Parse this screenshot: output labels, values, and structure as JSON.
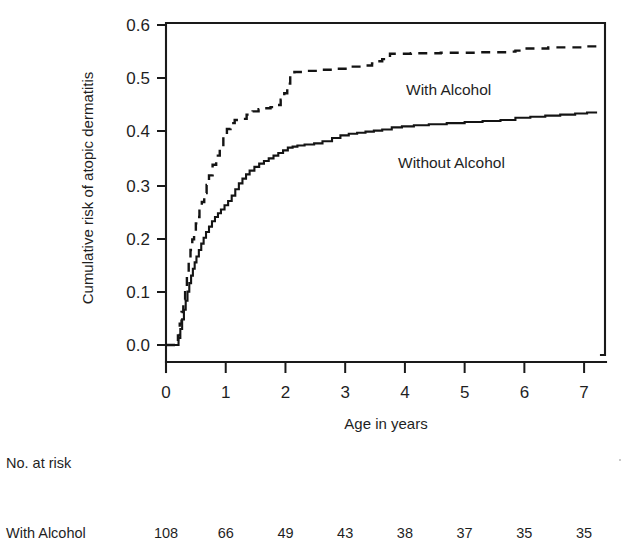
{
  "chart_data": {
    "type": "line",
    "title": "",
    "xlabel": "Age in years",
    "ylabel": "Cumulative risk of atopic dermatitis",
    "xlim": [
      0,
      7.35
    ],
    "ylim": [
      0,
      0.625
    ],
    "xticks": [
      0,
      1,
      2,
      3,
      4,
      5,
      6,
      7
    ],
    "xticklabels": [
      "0",
      "1",
      "2",
      "3",
      "4",
      "5",
      "6",
      "7"
    ],
    "yticks": [
      0.0,
      0.1,
      0.2,
      0.3,
      0.4,
      0.5,
      0.6
    ],
    "yticklabels": [
      "0.0",
      "0.1",
      "0.2",
      "0.3",
      "0.4",
      "0.5",
      "0.6"
    ],
    "grid": false,
    "legend_position": "inline-annotations",
    "series": [
      {
        "name": "With Alcohol",
        "style": "dashed",
        "annotation": "With Alcohol",
        "x": [
          0.0,
          0.17,
          0.2,
          0.23,
          0.26,
          0.29,
          0.32,
          0.35,
          0.38,
          0.41,
          0.44,
          0.47,
          0.5,
          0.53,
          0.56,
          0.6,
          0.64,
          0.68,
          0.72,
          0.78,
          0.84,
          0.9,
          0.96,
          1.02,
          1.08,
          1.15,
          1.25,
          1.35,
          1.45,
          1.55,
          1.65,
          1.75,
          1.85,
          1.92,
          1.98,
          2.03,
          2.08,
          2.15,
          2.3,
          2.55,
          2.85,
          3.1,
          3.3,
          3.45,
          3.55,
          3.62,
          3.75,
          4.1,
          4.6,
          5.2,
          5.7,
          5.85,
          5.95,
          6.4,
          7.0,
          7.3
        ],
        "y": [
          0.0,
          0.0,
          0.018,
          0.04,
          0.062,
          0.085,
          0.11,
          0.135,
          0.158,
          0.178,
          0.198,
          0.213,
          0.228,
          0.24,
          0.252,
          0.268,
          0.285,
          0.3,
          0.318,
          0.338,
          0.355,
          0.372,
          0.39,
          0.405,
          0.416,
          0.422,
          0.424,
          0.432,
          0.438,
          0.442,
          0.444,
          0.446,
          0.45,
          0.46,
          0.472,
          0.49,
          0.505,
          0.512,
          0.514,
          0.516,
          0.518,
          0.522,
          0.524,
          0.528,
          0.532,
          0.536,
          0.546,
          0.547,
          0.548,
          0.549,
          0.55,
          0.552,
          0.556,
          0.558,
          0.56,
          0.56
        ]
      },
      {
        "name": "Without Alcohol",
        "style": "solid",
        "annotation": "Without Alcohol",
        "x": [
          0.0,
          0.18,
          0.21,
          0.24,
          0.27,
          0.3,
          0.33,
          0.36,
          0.39,
          0.42,
          0.45,
          0.48,
          0.51,
          0.55,
          0.59,
          0.63,
          0.67,
          0.72,
          0.77,
          0.82,
          0.87,
          0.92,
          0.98,
          1.04,
          1.1,
          1.16,
          1.22,
          1.28,
          1.34,
          1.4,
          1.48,
          1.56,
          1.64,
          1.72,
          1.8,
          1.88,
          1.96,
          2.04,
          2.12,
          2.2,
          2.32,
          2.48,
          2.62,
          2.78,
          2.92,
          3.06,
          3.2,
          3.34,
          3.48,
          3.62,
          3.78,
          3.95,
          4.15,
          4.4,
          4.7,
          5.0,
          5.3,
          5.6,
          5.85,
          6.1,
          6.35,
          6.6,
          6.85,
          7.05,
          7.2
        ],
        "y": [
          0.0,
          0.0,
          0.013,
          0.03,
          0.048,
          0.066,
          0.083,
          0.1,
          0.116,
          0.13,
          0.143,
          0.155,
          0.166,
          0.178,
          0.19,
          0.201,
          0.212,
          0.222,
          0.232,
          0.24,
          0.247,
          0.254,
          0.262,
          0.27,
          0.28,
          0.292,
          0.303,
          0.312,
          0.32,
          0.327,
          0.334,
          0.34,
          0.345,
          0.35,
          0.355,
          0.36,
          0.365,
          0.37,
          0.372,
          0.374,
          0.376,
          0.378,
          0.382,
          0.388,
          0.393,
          0.396,
          0.398,
          0.4,
          0.402,
          0.404,
          0.408,
          0.41,
          0.412,
          0.414,
          0.416,
          0.418,
          0.42,
          0.422,
          0.426,
          0.428,
          0.43,
          0.432,
          0.434,
          0.436,
          0.438
        ]
      }
    ]
  },
  "risk_table": {
    "heading": "No. at risk",
    "rows": [
      {
        "label": "With Alcohol",
        "values": [
          "108",
          "66",
          "49",
          "43",
          "38",
          "37",
          "35",
          "35"
        ]
      }
    ]
  }
}
